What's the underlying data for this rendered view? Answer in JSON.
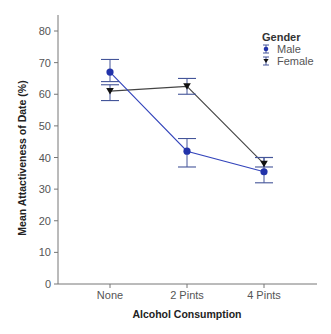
{
  "chart_data": {
    "type": "line",
    "title": "",
    "xlabel": "Alcohol Consumption",
    "ylabel": "Mean Attactiveness of Date (%)",
    "categories": [
      "None",
      "2 Pints",
      "4 Pints"
    ],
    "ylim": [
      0,
      85
    ],
    "yticks": [
      0,
      10,
      20,
      30,
      40,
      50,
      60,
      70,
      80
    ],
    "grid": false,
    "legend": {
      "title": "Gender",
      "position": "top-right"
    },
    "series": [
      {
        "name": "Male",
        "marker": "circle",
        "color": "#2233aa",
        "line_color": "#3344bb",
        "values": [
          67,
          42,
          35.5
        ],
        "error_low": [
          64,
          37,
          32
        ],
        "error_high": [
          71,
          46,
          40
        ]
      },
      {
        "name": "Female",
        "marker": "triangle-down",
        "color": "#111111",
        "line_color": "#444444",
        "values": [
          61,
          62.5,
          38
        ],
        "error_low": [
          58,
          60,
          37
        ],
        "error_high": [
          63,
          65,
          40
        ]
      }
    ],
    "errorbar_color": "#445599"
  }
}
